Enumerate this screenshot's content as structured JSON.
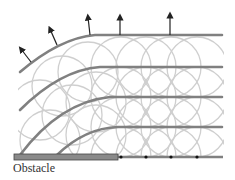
{
  "diagram": {
    "obstacle_label": "Obstacle",
    "colors": {
      "wavefront": "#808080",
      "wavelet": "#cfcfcf",
      "obstacle_fill": "#8a8a8a",
      "obstacle_stroke": "#444444",
      "arrow": "#222222",
      "source_point": "#111111"
    },
    "wavefront_count": 4,
    "point_sources_x": [
      121,
      146,
      171,
      197
    ],
    "arrow_count": 5
  }
}
